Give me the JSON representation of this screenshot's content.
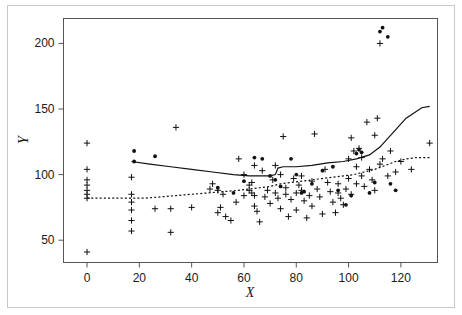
{
  "chart_data": {
    "type": "scatter",
    "title": "",
    "subtitle": "",
    "xlabel": "X",
    "ylabel": "Y",
    "xlim": [
      -9,
      134
    ],
    "ylim": [
      33,
      219
    ],
    "xticks": [
      0,
      20,
      40,
      60,
      80,
      100,
      120
    ],
    "yticks": [
      50,
      100,
      150,
      200
    ],
    "xtick_labels": [
      "0",
      "20",
      "40",
      "60",
      "80",
      "100",
      "120"
    ],
    "ytick_labels": [
      "50",
      "100",
      "150",
      "200"
    ],
    "grid": false,
    "legend": null,
    "legend_position": "none",
    "marker_styles": {
      "cross": "plus-marker",
      "dot": "filled-circle-marker"
    },
    "series": [
      {
        "name": "cross-points",
        "marker": "cross",
        "color": "#111111",
        "points": [
          [
            0,
            124
          ],
          [
            0,
            104
          ],
          [
            0,
            96
          ],
          [
            0,
            92
          ],
          [
            0,
            88
          ],
          [
            0,
            85
          ],
          [
            0,
            82
          ],
          [
            0,
            41
          ],
          [
            17,
            98
          ],
          [
            17,
            85
          ],
          [
            17,
            79
          ],
          [
            17,
            73
          ],
          [
            17,
            65
          ],
          [
            17,
            57
          ],
          [
            26,
            74
          ],
          [
            32,
            56
          ],
          [
            32,
            74
          ],
          [
            34,
            136
          ],
          [
            40,
            75
          ],
          [
            47,
            89
          ],
          [
            48,
            93
          ],
          [
            50,
            88
          ],
          [
            50,
            71
          ],
          [
            51,
            75
          ],
          [
            52,
            85
          ],
          [
            53,
            68
          ],
          [
            55,
            65
          ],
          [
            57,
            79
          ],
          [
            58,
            112
          ],
          [
            60,
            84
          ],
          [
            60,
            100
          ],
          [
            62,
            92
          ],
          [
            62,
            88
          ],
          [
            63,
            86
          ],
          [
            63,
            94
          ],
          [
            64,
            107
          ],
          [
            64,
            84
          ],
          [
            64,
            76
          ],
          [
            65,
            72
          ],
          [
            66,
            64
          ],
          [
            67,
            103
          ],
          [
            68,
            83
          ],
          [
            69,
            88
          ],
          [
            70,
            78
          ],
          [
            71,
            96
          ],
          [
            72,
            107
          ],
          [
            72,
            86
          ],
          [
            73,
            82
          ],
          [
            74,
            100
          ],
          [
            74,
            74
          ],
          [
            75,
            129
          ],
          [
            76,
            85
          ],
          [
            76,
            90
          ],
          [
            77,
            68
          ],
          [
            78,
            81
          ],
          [
            79,
            97
          ],
          [
            80,
            86
          ],
          [
            80,
            73
          ],
          [
            81,
            92
          ],
          [
            82,
            88
          ],
          [
            82,
            99
          ],
          [
            83,
            80
          ],
          [
            84,
            67
          ],
          [
            85,
            84
          ],
          [
            86,
            95
          ],
          [
            86,
            76
          ],
          [
            87,
            131
          ],
          [
            88,
            89
          ],
          [
            89,
            83
          ],
          [
            90,
            70
          ],
          [
            91,
            104
          ],
          [
            92,
            94
          ],
          [
            93,
            87
          ],
          [
            94,
            79
          ],
          [
            95,
            71
          ],
          [
            96,
            93
          ],
          [
            96,
            86
          ],
          [
            97,
            82
          ],
          [
            98,
            77
          ],
          [
            99,
            89
          ],
          [
            100,
            112
          ],
          [
            100,
            97
          ],
          [
            101,
            128
          ],
          [
            101,
            85
          ],
          [
            102,
            118
          ],
          [
            103,
            93
          ],
          [
            103,
            106
          ],
          [
            104,
            120
          ],
          [
            105,
            99
          ],
          [
            105,
            113
          ],
          [
            106,
            91
          ],
          [
            107,
            140
          ],
          [
            108,
            104
          ],
          [
            109,
            96
          ],
          [
            110,
            130
          ],
          [
            110,
            88
          ],
          [
            111,
            143
          ],
          [
            112,
            200
          ],
          [
            112,
            108
          ],
          [
            113,
            112
          ],
          [
            115,
            99
          ],
          [
            116,
            118
          ],
          [
            118,
            102
          ],
          [
            120,
            110
          ],
          [
            124,
            104
          ],
          [
            131,
            124
          ]
        ]
      },
      {
        "name": "dot-points",
        "marker": "dot",
        "color": "#111111",
        "points": [
          [
            18,
            110
          ],
          [
            18,
            118
          ],
          [
            26,
            114
          ],
          [
            50,
            90
          ],
          [
            56,
            86
          ],
          [
            60,
            95
          ],
          [
            64,
            113
          ],
          [
            67,
            112
          ],
          [
            70,
            99
          ],
          [
            72,
            96
          ],
          [
            74,
            91
          ],
          [
            78,
            112
          ],
          [
            80,
            100
          ],
          [
            82,
            86
          ],
          [
            83,
            87
          ],
          [
            86,
            93
          ],
          [
            90,
            103
          ],
          [
            94,
            106
          ],
          [
            96,
            88
          ],
          [
            99,
            77
          ],
          [
            101,
            84
          ],
          [
            103,
            116
          ],
          [
            104,
            119
          ],
          [
            105,
            117
          ],
          [
            108,
            86
          ],
          [
            110,
            94
          ],
          [
            112,
            209
          ],
          [
            113,
            212
          ],
          [
            115,
            205
          ],
          [
            116,
            93
          ],
          [
            118,
            88
          ]
        ]
      }
    ],
    "lines": [
      {
        "name": "solid-fit-line",
        "style": "solid",
        "color": "#111111",
        "width": 1.2,
        "points": [
          [
            17,
            110
          ],
          [
            24,
            108
          ],
          [
            32,
            106
          ],
          [
            40,
            104
          ],
          [
            48,
            102
          ],
          [
            56,
            100
          ],
          [
            62,
            99
          ],
          [
            66,
            99
          ],
          [
            70,
            99
          ],
          [
            72,
            100
          ],
          [
            73,
            105
          ],
          [
            75,
            106
          ],
          [
            80,
            106
          ],
          [
            86,
            107
          ],
          [
            92,
            109
          ],
          [
            98,
            110
          ],
          [
            103,
            112
          ],
          [
            108,
            115
          ],
          [
            112,
            121
          ],
          [
            117,
            132
          ],
          [
            122,
            143
          ],
          [
            128,
            151
          ],
          [
            131,
            152
          ]
        ]
      },
      {
        "name": "dotted-fit-line",
        "style": "dotted",
        "color": "#111111",
        "width": 1.2,
        "points": [
          [
            0,
            82
          ],
          [
            8,
            82
          ],
          [
            16,
            82
          ],
          [
            22,
            82
          ],
          [
            28,
            83
          ],
          [
            34,
            84
          ],
          [
            40,
            85
          ],
          [
            46,
            86
          ],
          [
            52,
            87
          ],
          [
            58,
            88
          ],
          [
            62,
            89
          ],
          [
            66,
            90
          ],
          [
            70,
            91
          ],
          [
            74,
            93
          ],
          [
            78,
            94
          ],
          [
            82,
            95
          ],
          [
            86,
            96
          ],
          [
            90,
            97
          ],
          [
            94,
            98
          ],
          [
            98,
            99
          ],
          [
            102,
            100
          ],
          [
            106,
            102
          ],
          [
            110,
            104
          ],
          [
            114,
            107
          ],
          [
            118,
            110
          ],
          [
            122,
            112
          ],
          [
            126,
            113
          ],
          [
            131,
            113
          ]
        ]
      }
    ]
  },
  "figure": {
    "outer_frame_color": "#c9c9c9",
    "axis_color": "#555555",
    "background": "#ffffff"
  }
}
